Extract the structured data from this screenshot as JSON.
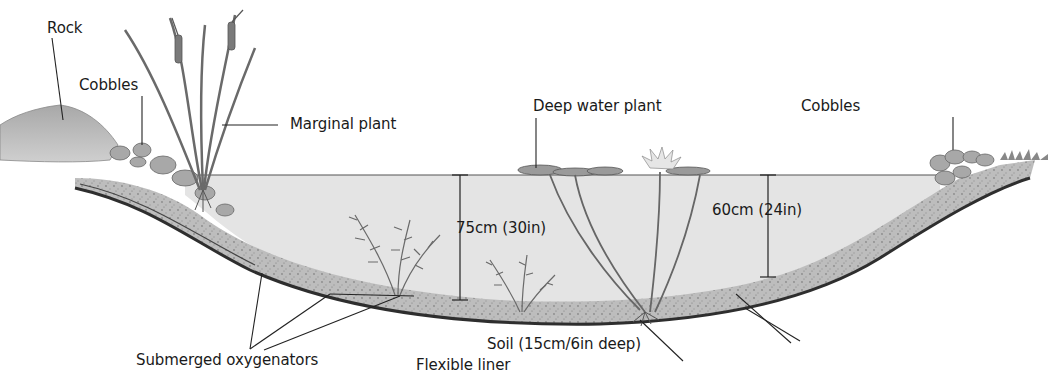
{
  "diagram": {
    "labels": {
      "rock": "Rock",
      "cobbles_left": "Cobbles",
      "marginal_plant": "Marginal plant",
      "deep_water_plant": "Deep water plant",
      "cobbles_right": "Cobbles",
      "depth_left": "75cm (30in)",
      "depth_right": "60cm (24in)",
      "submerged_oxygenators": "Submerged oxygenators",
      "flexible_liner": "Flexible liner",
      "soil": "Soil (15cm/6in deep)"
    },
    "colors": {
      "water": "#e4e4e4",
      "soil": "#b8b8b8",
      "liner": "#3a3a3a",
      "rock": "#9a9a9a",
      "plant": "#6a6a6a",
      "text": "#1a1a1a"
    }
  }
}
